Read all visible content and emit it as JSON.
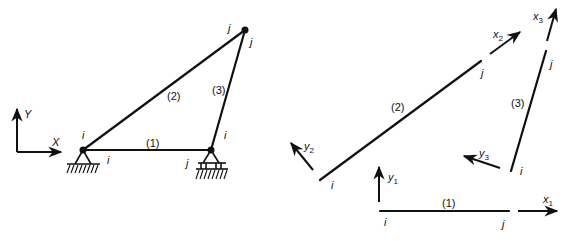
{
  "figure": {
    "left_panel": {
      "global_axes": {
        "x_label": "X",
        "y_label": "Y"
      },
      "members": [
        {
          "id": "1",
          "label": "(1)",
          "start_node": "i",
          "end_node": "j"
        },
        {
          "id": "2",
          "label": "(2)",
          "start_node": "i",
          "end_node": "j"
        },
        {
          "id": "3",
          "label": "(3)",
          "start_node": "i",
          "end_node": "j"
        }
      ],
      "node_labels": {
        "left_support_member2": "i",
        "left_support_member1": "i",
        "right_support_member1": "j",
        "right_support_member3": "i",
        "top_member2": "j",
        "top_member3": "j"
      },
      "supports": [
        {
          "name": "pin-support",
          "type": "pinned"
        },
        {
          "name": "roller-support",
          "type": "roller"
        }
      ]
    },
    "right_panel": {
      "members": [
        {
          "id": "1",
          "label": "(1)",
          "i_label": "i",
          "j_label": "j",
          "x_axis": "x",
          "x_sub": "1",
          "y_axis": "y",
          "y_sub": "1"
        },
        {
          "id": "2",
          "label": "(2)",
          "i_label": "i",
          "j_label": "j",
          "x_axis": "x",
          "x_sub": "2",
          "y_axis": "y",
          "y_sub": "2"
        },
        {
          "id": "3",
          "label": "(3)",
          "i_label": "i",
          "j_label": "j",
          "x_axis": "x",
          "x_sub": "3",
          "y_axis": "y",
          "y_sub": "3"
        }
      ]
    }
  }
}
